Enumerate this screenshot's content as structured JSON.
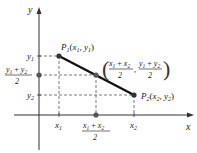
{
  "diagram": {
    "axes": {
      "x_label": "x",
      "y_label": "y"
    },
    "points": {
      "p1": {
        "name": "P",
        "sub": "1",
        "coords": "(x₁, y₁)"
      },
      "p2": {
        "name": "P",
        "sub": "2",
        "coords": "(x₂, y₂)"
      },
      "midpoint": {
        "label": "((x₁ + x₂)/2, (y₁ + y₂)/2)"
      }
    },
    "x_ticks": {
      "x1": "x₁",
      "mid_num": "x₁ + x₂",
      "mid_den": "2",
      "x2": "x₂"
    },
    "y_ticks": {
      "y1": "y₁",
      "mid_num": "y₁ + y₂",
      "mid_den": "2",
      "y2": "y₂"
    },
    "mid_label": {
      "x_num": "x₁ + x₂",
      "x_den": "2",
      "y_num": "y₁ + y₂",
      "y_den": "2",
      "comma": ","
    },
    "colors": {
      "line": "#111111",
      "axis": "#333333",
      "dashed": "#444444",
      "point_fill": "#333333"
    }
  }
}
